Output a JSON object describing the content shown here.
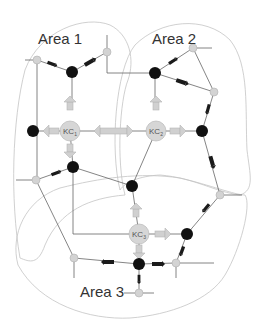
{
  "diagram": {
    "areas": [
      {
        "id": "area1",
        "label": "Area 1"
      },
      {
        "id": "area2",
        "label": "Area 2"
      },
      {
        "id": "area3",
        "label": "Area 3"
      }
    ],
    "coordinators": [
      {
        "id": "kc1",
        "label": "KC",
        "sub": "1",
        "x": 70,
        "y": 131
      },
      {
        "id": "kc2",
        "label": "KC",
        "sub": "2",
        "x": 156,
        "y": 131
      },
      {
        "id": "kc3",
        "label": "KC",
        "sub": "3",
        "x": 139,
        "y": 234
      }
    ],
    "colors": {
      "boundary": "#bdbdbd",
      "edge": "#666666",
      "agent_node": "#111111",
      "bus_node": "#d3d3d3",
      "kc_fill": "#d6d6d6",
      "hollow_arrow": "#d0d0d0",
      "flow_arrow": "#1a1a1a"
    },
    "legend_semantics": {
      "black_node": "agent",
      "gray_small_node": "bus",
      "gray_large_node": "knowledge coordinator",
      "hollow_arrow": "coordination signal",
      "black_arrow": "power flow"
    }
  }
}
